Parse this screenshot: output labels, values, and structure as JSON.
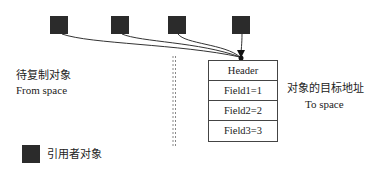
{
  "diagram": {
    "referrer_squares": [
      {
        "id": "ref-1",
        "x": 50,
        "y": 16
      },
      {
        "id": "ref-2",
        "x": 111,
        "y": 16
      },
      {
        "id": "ref-3",
        "x": 168,
        "y": 16
      },
      {
        "id": "ref-4",
        "x": 232,
        "y": 16
      }
    ],
    "from_space": {
      "label_cn": "待复制对象",
      "label_en": "From space"
    },
    "to_space": {
      "label_cn": "对象的目标地址",
      "label_en": "To space"
    },
    "target_object": {
      "rows": [
        {
          "label": "Header"
        },
        {
          "label": "Field1=1"
        },
        {
          "label": "Field2=2"
        },
        {
          "label": "Field3=3"
        }
      ]
    },
    "legend": {
      "label": "引用者对象"
    },
    "colors": {
      "square": "#2b2b2b",
      "line": "#333333",
      "divider": "#888888"
    }
  }
}
